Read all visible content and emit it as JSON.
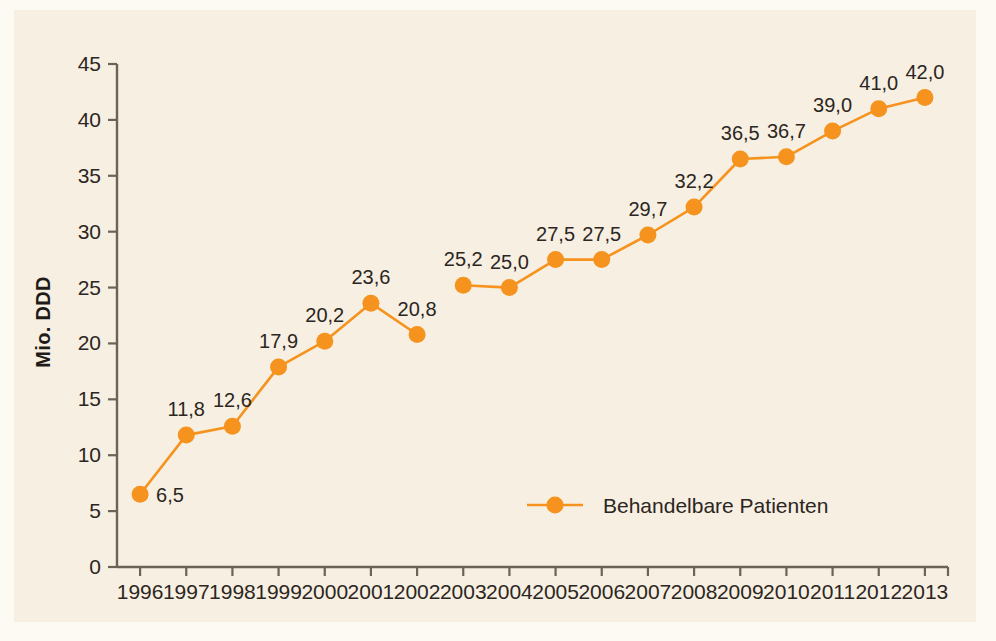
{
  "chart_data": {
    "type": "line",
    "title": "",
    "xlabel": "",
    "ylabel": "Mio. DDD",
    "x": [
      "1996",
      "1997",
      "1998",
      "1999",
      "2000",
      "2001",
      "2002",
      "2003",
      "2004",
      "2005",
      "2006",
      "2007",
      "2008",
      "2009",
      "2010",
      "2011",
      "2012",
      "2013"
    ],
    "categories": [
      "1996",
      "1997",
      "1998",
      "1999",
      "2000",
      "2001",
      "2002",
      "2003",
      "2004",
      "2005",
      "2006",
      "2007",
      "2008",
      "2009",
      "2010",
      "2011",
      "2012",
      "2013"
    ],
    "values": [
      6.5,
      11.8,
      12.6,
      17.9,
      20.2,
      23.6,
      20.8,
      25.2,
      25.0,
      27.5,
      27.5,
      29.7,
      32.2,
      36.5,
      36.7,
      39.0,
      41.0,
      42.0
    ],
    "point_labels": [
      "6,5",
      "11,8",
      "12,6",
      "17,9",
      "20,2",
      "23,6",
      "20,8",
      "25,2",
      "25,0",
      "27,5",
      "27,5",
      "29,7",
      "32,2",
      "36,5",
      "36,7",
      "39,0",
      "41,0",
      "42,0"
    ],
    "series": [
      {
        "name": "Behandelbare Patienten",
        "color": "#f5931e",
        "values": [
          6.5,
          11.8,
          12.6,
          17.9,
          20.2,
          23.6,
          20.8,
          25.2,
          25.0,
          27.5,
          27.5,
          29.7,
          32.2,
          36.5,
          36.7,
          39.0,
          41.0,
          42.0
        ],
        "line_break_after": "2002"
      }
    ],
    "ylim": [
      0,
      45
    ],
    "yticks": [
      0,
      5,
      10,
      15,
      20,
      25,
      30,
      35,
      40,
      45
    ],
    "ytick_labels": [
      "0",
      "5",
      "10",
      "15",
      "20",
      "25",
      "30",
      "35",
      "40",
      "45"
    ],
    "grid": false,
    "legend_position": "inside-bottom-center",
    "legend": [
      {
        "label": "Behandelbare Patienten",
        "color": "#f5931e",
        "marker": "circle"
      }
    ]
  },
  "style": {
    "background": "#f7efe1",
    "frame": "#fdfaf4",
    "accent": "#f5931e",
    "axis": "#6b6258",
    "text": "#2b2622"
  },
  "axis": {
    "y_title": "Mio. DDD"
  }
}
